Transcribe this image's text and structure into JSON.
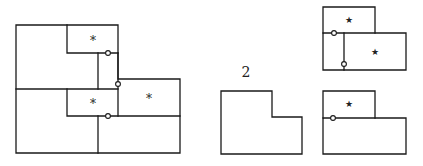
{
  "diagram": {
    "stroke_color": "#1a1a1a",
    "label_middle": "2",
    "marker_asterisk": "*",
    "marker_star": "★",
    "left_figure": {
      "name": "tiled-l-region",
      "asterisks": 3,
      "junction_circles": 3
    },
    "middle_figure": {
      "name": "l-shape",
      "label": "2"
    },
    "right_top_figure": {
      "name": "two-rectangle-composition-a",
      "stars": 2,
      "junction_circles": 2
    },
    "right_bottom_figure": {
      "name": "two-rectangle-composition-b",
      "stars": 1,
      "junction_circles": 1
    }
  }
}
